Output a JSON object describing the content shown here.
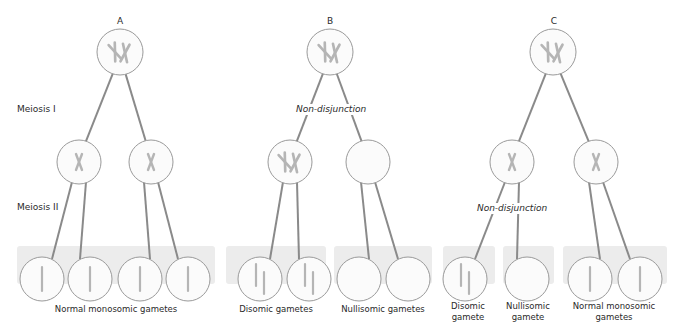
{
  "panels": [
    {
      "letter": "A",
      "non_disjunction_stage": "none",
      "groups": [
        {
          "label": "Normal monosomic gametes",
          "gamete_type": "monosomic",
          "count": 4
        }
      ]
    },
    {
      "letter": "B",
      "non_disjunction_stage": "Meiosis I",
      "groups": [
        {
          "label": "Disomic gametes",
          "gamete_type": "disomic",
          "count": 2
        },
        {
          "label": "Nullisomic gametes",
          "gamete_type": "nullisomic",
          "count": 2
        }
      ]
    },
    {
      "letter": "C",
      "non_disjunction_stage": "Meiosis II",
      "groups": [
        {
          "label": "Disomic gamete",
          "gamete_type": "disomic",
          "count": 1
        },
        {
          "label": "Nullisomic gamete",
          "gamete_type": "nullisomic",
          "count": 1
        },
        {
          "label": "Normal monosomic gametes",
          "gamete_type": "monosomic",
          "count": 2
        }
      ]
    }
  ],
  "row_labels": {
    "meiosis1": "Meiosis I",
    "meiosis2": "Meiosis II"
  },
  "annotations": {
    "non_disjunction": "Non-disjunction"
  },
  "gamete_labels": {
    "a_group": "Normal monosomic gametes",
    "b_disomic": "Disomic gametes",
    "b_nullisomic": "Nullisomic gametes",
    "c_disomic_1": "Disomic",
    "c_disomic_2": "gamete",
    "c_nulli_1": "Nullisomic",
    "c_nulli_2": "gamete",
    "c_normal_1": "Normal monosomic",
    "c_normal_2": "gametes"
  },
  "colors": {
    "line": "#8a8a8a",
    "cell_stroke": "#9a9a9a",
    "cell_fill": "#fbfbfb",
    "chromosome": "#b5b5b5",
    "gamete_box": "#ececec"
  }
}
